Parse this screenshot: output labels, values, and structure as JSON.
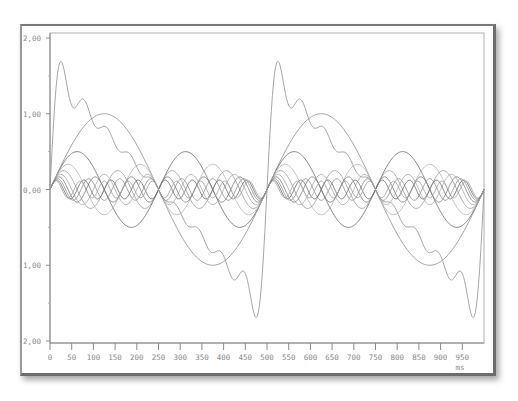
{
  "chart_data": {
    "type": "line",
    "title": "",
    "xlabel": "ms",
    "ylabel": "",
    "xlim": [
      0,
      1000
    ],
    "ylim": [
      -2,
      2
    ],
    "grid": false,
    "legend": null,
    "x_ticks": [
      0,
      50,
      100,
      150,
      200,
      250,
      300,
      350,
      400,
      450,
      500,
      550,
      600,
      650,
      700,
      750,
      800,
      850,
      900,
      950
    ],
    "y_ticks": [
      2,
      1,
      0,
      -1,
      -2
    ],
    "y_tick_labels": [
      "2,00",
      "1,00",
      "0,00",
      "-1,00",
      "-2,00"
    ],
    "series": [
      {
        "name": "harmonic 1",
        "freq_hz": 2,
        "amplitude": 1.0,
        "color": "#8c8c8c"
      },
      {
        "name": "harmonic 2",
        "freq_hz": 4,
        "amplitude": 0.5,
        "color": "#6a6a6a"
      },
      {
        "name": "harmonic 3",
        "freq_hz": 6,
        "amplitude": 0.333,
        "color": "#b4b4b4"
      },
      {
        "name": "harmonic 4",
        "freq_hz": 8,
        "amplitude": 0.25,
        "color": "#9a9a9a"
      },
      {
        "name": "harmonic 5",
        "freq_hz": 10,
        "amplitude": 0.2,
        "color": "#a8a8a8"
      },
      {
        "name": "harmonic 6",
        "freq_hz": 12,
        "amplitude": 0.167,
        "color": "#7c7c7c"
      },
      {
        "name": "harmonic 7",
        "freq_hz": 14,
        "amplitude": 0.143,
        "color": "#909090"
      },
      {
        "name": "harmonic 8",
        "freq_hz": 16,
        "amplitude": 0.125,
        "color": "#707070"
      },
      {
        "name": "harmonic 9",
        "freq_hz": 18,
        "amplitude": 0.111,
        "color": "#a0a0a0"
      }
    ],
    "sum_series": {
      "name": "sum",
      "color": "#9c9c9c",
      "x": [
        0,
        25,
        50,
        75,
        100,
        125,
        150,
        175,
        200,
        225,
        250,
        275,
        300,
        325,
        350,
        375,
        400,
        425,
        450,
        475,
        500,
        525,
        550,
        575,
        600,
        625,
        650,
        675,
        700,
        725,
        750,
        775,
        800,
        825,
        850,
        875,
        900,
        925,
        950,
        975,
        1000
      ],
      "y": [
        0,
        1.66,
        1.14,
        1.08,
        0.94,
        0.78,
        0.63,
        0.47,
        0.31,
        0.16,
        0,
        -0.16,
        -0.31,
        -0.47,
        -0.63,
        -0.78,
        -0.94,
        -1.08,
        -1.14,
        -1.66,
        0,
        1.66,
        1.14,
        1.08,
        0.94,
        0.78,
        0.63,
        0.47,
        0.31,
        0.16,
        0,
        -0.16,
        -0.31,
        -0.47,
        -0.63,
        -0.78,
        -0.94,
        -1.08,
        -1.14,
        -1.66,
        0
      ]
    }
  }
}
